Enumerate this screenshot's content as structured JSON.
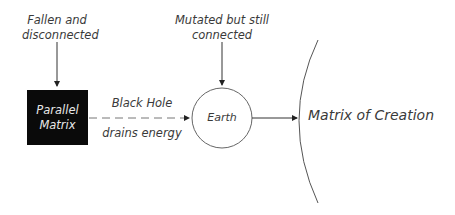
{
  "diagram": {
    "nodes": {
      "parallel_matrix": {
        "line1": "Parallel",
        "line2": "Matrix",
        "fill": "#0a0a0a"
      },
      "earth": {
        "label": "Earth"
      },
      "matrix_of_creation": {
        "label": "Matrix of Creation"
      }
    },
    "annotations": {
      "fallen": {
        "line1": "Fallen and",
        "line2": "disconnected"
      },
      "mutated": {
        "line1": "Mutated but still",
        "line2": "connected"
      }
    },
    "edges": {
      "black_hole": {
        "above": "Black Hole",
        "below": "drains energy",
        "style": "dashed"
      }
    }
  }
}
